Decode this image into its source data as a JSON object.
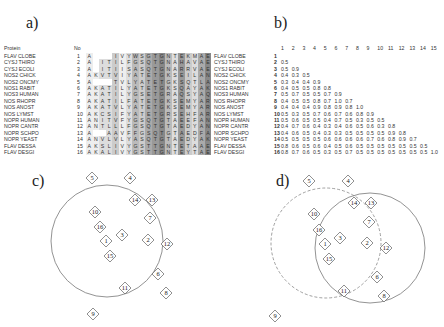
{
  "panels": {
    "a": "a)",
    "b": "b)",
    "c": "c)",
    "d": "d)"
  },
  "alignment": {
    "header_protein": "Protein",
    "header_no": "No",
    "rows": [
      {
        "name": "FLAV CLOBE",
        "no": "1",
        "seq": "A...IVYWSGTGNTEKMAE"
      },
      {
        "name": "CYSJ THIRO",
        "no": "2",
        "seq": "A.ITILFGSQTGNAHAVAE"
      },
      {
        "name": "CYSJ ECOLI",
        "no": "3",
        "seq": "A.ITIISASQTGNARRVAE"
      },
      {
        "name": "NOS2 CHICK",
        "no": "4",
        "seq": "AKVTVIYATETGKSEILAN"
      },
      {
        "name": "NOS2 ONCMY",
        "no": "5",
        "seq": "A...TVLYATETGKSQTLAG"
      },
      {
        "name": "NOS1 RABIT",
        "no": "6",
        "seq": "AKATILYATETGKSQAYAK"
      },
      {
        "name": "NOS3 HUMAN",
        "no": "7",
        "seq": "AKATILYGSETGRAQSYAQ"
      },
      {
        "name": "NOS RHOPR",
        "no": "8",
        "seq": "AKATILFATETGKSEMYAR"
      },
      {
        "name": "NOS ANOST",
        "no": "9",
        "seq": "AKATVLYATETGKSEMYAR"
      },
      {
        "name": "NOS LYMST",
        "no": "10",
        "seq": "AKCSIFYATETGRSEHFAR"
      },
      {
        "name": "NOPR HUMAN",
        "no": "11",
        "seq": "ANITVFYGSQTGTAEEFAN"
      },
      {
        "name": "NOPR CANTR",
        "no": "12",
        "seq": "ANTLLLFGSQTGTAEDYAN"
      },
      {
        "name": "NOPR SCHPO",
        "no": "13",
        "seq": "A..AAVFFGSQTGTAEDFAV"
      },
      {
        "name": "NOPR YEAST",
        "no": "14",
        "seq": "ANVLVLYASQTGTAEDYAK"
      },
      {
        "name": "FLAV DESSA",
        "no": "15",
        "seq": "AKSLIVYGSTTGNTETAAE"
      },
      {
        "name": "FLAV DESGI",
        "no": "16",
        "seq": "AKALIVYGSTTGNTEYTAE"
      }
    ]
  },
  "matrix": {
    "col_headers": [
      "1",
      "2",
      "3",
      "4",
      "5",
      "6",
      "7",
      "8",
      "9",
      "10",
      "11",
      "12",
      "13",
      "14",
      "15"
    ],
    "rows": [
      {
        "name": "FLAV CLOBE",
        "n": "1",
        "v": []
      },
      {
        "name": "CYSJ THIRO",
        "n": "2",
        "v": [
          "0.5"
        ]
      },
      {
        "name": "CYSJ ECOLI",
        "n": "3",
        "v": [
          "0.5",
          "0.9"
        ]
      },
      {
        "name": "NOS2 CHICK",
        "n": "4",
        "v": [
          "0.4",
          "0.3",
          "0.5"
        ]
      },
      {
        "name": "NOS2 ONCMY",
        "n": "5",
        "v": [
          "0.3",
          "0.4",
          "0.4",
          "0.9"
        ]
      },
      {
        "name": "NOS1 RABIT",
        "n": "6",
        "v": [
          "0.4",
          "0.5",
          "0.5",
          "0.8",
          "0.8"
        ]
      },
      {
        "name": "NOS3 HUMAN",
        "n": "7",
        "v": [
          "0.5",
          "0.7",
          "0.5",
          "0.5",
          "0.7",
          "0.9"
        ]
      },
      {
        "name": "NOS RHOPR",
        "n": "8",
        "v": [
          "0.4",
          "0.5",
          "0.5",
          "0.8",
          "0.7",
          "1.0",
          "0.7"
        ]
      },
      {
        "name": "NOS ANOST",
        "n": "9",
        "v": [
          "0.4",
          "0.4",
          "0.4",
          "0.9",
          "0.8",
          "0.9",
          "0.8",
          "1.0"
        ]
      },
      {
        "name": "NOS LYMST",
        "n": "10",
        "v": [
          "0.5",
          "0.3",
          "0.5",
          "0.7",
          "0.6",
          "0.7",
          "0.6",
          "0.8",
          "0.9"
        ]
      },
      {
        "name": "NOPR HUMAN",
        "n": "11",
        "v": [
          "0.5",
          "0.6",
          "0.5",
          "0.5",
          "0.4",
          "0.7",
          "0.5",
          "0.3",
          "0.5",
          "0.5"
        ]
      },
      {
        "name": "NOPR CANTR",
        "n": "12",
        "v": [
          "0.4",
          "0.7",
          "0.6",
          "0.4",
          "0.3",
          "0.4",
          "0.6",
          "0.5",
          "0.6",
          "0.3",
          "0.8"
        ]
      },
      {
        "name": "NOPR SCHPO",
        "n": "13",
        "v": [
          "0.4",
          "0.6",
          "0.5",
          "0.4",
          "0.3",
          "0.3",
          "0.5",
          "0.5",
          "0.5",
          "0.5",
          "0.9",
          "0.8"
        ]
      },
      {
        "name": "NOPR YEAST",
        "n": "14",
        "v": [
          "0.5",
          "0.5",
          "0.5",
          "0.5",
          "0.6",
          "0.6",
          "0.6",
          "0.6",
          "0.7",
          "0.6",
          "0.8",
          "0.9",
          "0.7"
        ]
      },
      {
        "name": "FLAV DESSA",
        "n": "15",
        "v": [
          "0.8",
          "0.6",
          "0.5",
          "0.6",
          "0.4",
          "0.5",
          "0.6",
          "0.5",
          "0.5",
          "0.5",
          "0.5",
          "0.5",
          "0.5",
          "0.5"
        ]
      },
      {
        "name": "FLAV DESGI",
        "n": "16",
        "v": [
          "0.8",
          "0.7",
          "0.6",
          "0.5",
          "0.3",
          "0.5",
          "0.7",
          "0.5",
          "0.5",
          "0.5",
          "0.5",
          "0.5",
          "0.5",
          "0.5",
          "1.0"
        ]
      }
    ]
  },
  "diagram_c": {
    "nodes": [
      {
        "id": "5",
        "x": 92,
        "y": 178
      },
      {
        "id": "4",
        "x": 130,
        "y": 178
      },
      {
        "id": "14",
        "x": 135,
        "y": 200
      },
      {
        "id": "13",
        "x": 152,
        "y": 200
      },
      {
        "id": "10",
        "x": 95,
        "y": 212
      },
      {
        "id": "7",
        "x": 150,
        "y": 218
      },
      {
        "id": "16",
        "x": 100,
        "y": 227
      },
      {
        "id": "3",
        "x": 122,
        "y": 235
      },
      {
        "id": "1",
        "x": 106,
        "y": 241
      },
      {
        "id": "2",
        "x": 148,
        "y": 240
      },
      {
        "id": "12",
        "x": 167,
        "y": 244
      },
      {
        "id": "15",
        "x": 110,
        "y": 256
      },
      {
        "id": "6",
        "x": 158,
        "y": 274
      },
      {
        "id": "11",
        "x": 125,
        "y": 288
      },
      {
        "id": "8",
        "x": 166,
        "y": 293
      },
      {
        "id": "9",
        "x": 93,
        "y": 314
      }
    ]
  },
  "diagram_d": {
    "nodes": [
      {
        "id": "5",
        "x": 309,
        "y": 181
      },
      {
        "id": "4",
        "x": 348,
        "y": 181
      },
      {
        "id": "14",
        "x": 354,
        "y": 203
      },
      {
        "id": "13",
        "x": 371,
        "y": 203
      },
      {
        "id": "10",
        "x": 314,
        "y": 214
      },
      {
        "id": "7",
        "x": 369,
        "y": 222
      },
      {
        "id": "16",
        "x": 319,
        "y": 230
      },
      {
        "id": "3",
        "x": 340,
        "y": 238
      },
      {
        "id": "1",
        "x": 325,
        "y": 244
      },
      {
        "id": "2",
        "x": 367,
        "y": 243
      },
      {
        "id": "12",
        "x": 386,
        "y": 248
      },
      {
        "id": "15",
        "x": 329,
        "y": 259
      },
      {
        "id": "6",
        "x": 377,
        "y": 277
      },
      {
        "id": "11",
        "x": 344,
        "y": 291
      },
      {
        "id": "8",
        "x": 384,
        "y": 296
      },
      {
        "id": "9",
        "x": 275,
        "y": 316
      }
    ]
  }
}
